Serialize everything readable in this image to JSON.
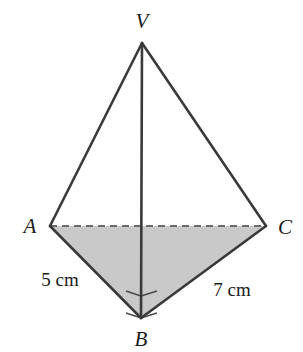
{
  "figure": {
    "kind": "geometry-diagram",
    "background_color": "#ffffff",
    "stroke_color": "#3a3a3a",
    "dashed_stroke_color": "#6b6b6b",
    "shade_color": "#c9c9c9",
    "text_color": "#1c1c1c"
  },
  "vertices": [
    {
      "name": "V",
      "label": "V",
      "x": 142,
      "y": 43,
      "label_x": 142,
      "label_y": 21
    },
    {
      "name": "A",
      "label": "A",
      "x": 50,
      "y": 226,
      "label_x": 30,
      "label_y": 226
    },
    {
      "name": "C",
      "label": "C",
      "x": 266,
      "y": 226,
      "label_x": 285,
      "label_y": 227
    },
    {
      "name": "B",
      "label": "B",
      "x": 141,
      "y": 318,
      "label_x": 141,
      "label_y": 339
    }
  ],
  "edges": [
    {
      "name": "edge-VA",
      "from": "V",
      "to": "A",
      "style": "solid"
    },
    {
      "name": "edge-VC",
      "from": "V",
      "to": "C",
      "style": "solid"
    },
    {
      "name": "edge-VB",
      "from": "V",
      "to": "B",
      "style": "solid"
    },
    {
      "name": "edge-AB",
      "from": "A",
      "to": "B",
      "style": "solid"
    },
    {
      "name": "edge-BC",
      "from": "B",
      "to": "C",
      "style": "solid"
    },
    {
      "name": "edge-AC",
      "from": "A",
      "to": "C",
      "style": "dashed"
    }
  ],
  "shaded_region": {
    "name": "base-triangle-ABC",
    "points": "A,C,B",
    "fill": "#c9c9c9"
  },
  "measurements": [
    {
      "name": "length-AB",
      "text": "5 cm",
      "value": 5,
      "unit": "cm",
      "x": 60,
      "y": 279,
      "edge": "AB"
    },
    {
      "name": "length-BC",
      "text": "7 cm",
      "value": 7,
      "unit": "cm",
      "x": 232,
      "y": 289,
      "edge": "BC"
    }
  ],
  "angle_marks": [
    {
      "name": "right-angle-ABV",
      "at": "B",
      "between": [
        "BA",
        "BV"
      ],
      "type": "right-angle-square",
      "size": 22
    },
    {
      "name": "right-angle-VBC",
      "at": "B",
      "between": [
        "BV",
        "BC"
      ],
      "type": "right-angle-square",
      "size": 22
    }
  ]
}
